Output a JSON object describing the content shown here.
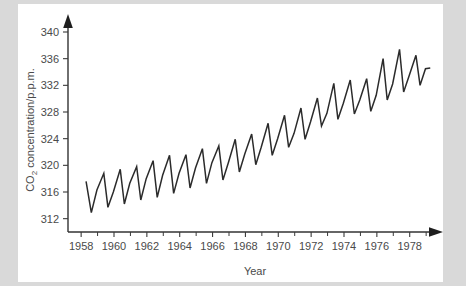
{
  "figure": {
    "background_color": "#d9d9d9",
    "card_color": "#ffffff",
    "line_color": "#2b2b2b",
    "axis_color": "#333333",
    "text_color": "#4a4a4a"
  },
  "chart_data": {
    "type": "line",
    "title": "",
    "xlabel": "Year",
    "ylabel_main": "CO",
    "ylabel_sub": "2",
    "ylabel_rest": " concentration/p.p.m.",
    "ylabel": "CO2 concentration/p.p.m.",
    "xlim": [
      1957.2,
      1979.6
    ],
    "ylim": [
      310.0,
      341.5
    ],
    "grid": false,
    "legend": null,
    "x_major_ticks": [
      1958,
      1960,
      1962,
      1964,
      1966,
      1968,
      1970,
      1972,
      1974,
      1976,
      1978
    ],
    "x_tick_labels": [
      "1958",
      "1960",
      "1962",
      "1964",
      "1966",
      "1968",
      "1970",
      "1972",
      "1974",
      "1976",
      "1978"
    ],
    "x_minor_ticks": [
      1959,
      1961,
      1963,
      1965,
      1967,
      1969,
      1971,
      1973,
      1975,
      1977,
      1979
    ],
    "y_major_ticks": [
      312,
      316,
      320,
      324,
      328,
      332,
      336,
      340
    ],
    "y_tick_labels": [
      "312",
      "316",
      "320",
      "324",
      "328",
      "332",
      "336",
      "340"
    ],
    "series": [
      {
        "name": "CO2 concentration",
        "x": [
          1958.3,
          1958.62,
          1958.96,
          1959.38,
          1959.63,
          1959.96,
          1960.38,
          1960.63,
          1960.96,
          1961.38,
          1961.63,
          1961.96,
          1962.38,
          1962.63,
          1962.96,
          1963.38,
          1963.63,
          1963.96,
          1964.38,
          1964.63,
          1964.96,
          1965.38,
          1965.63,
          1965.96,
          1966.38,
          1966.63,
          1966.96,
          1967.38,
          1967.63,
          1967.96,
          1968.38,
          1968.63,
          1968.96,
          1969.38,
          1969.63,
          1969.96,
          1970.38,
          1970.63,
          1970.96,
          1971.38,
          1971.63,
          1971.96,
          1972.38,
          1972.63,
          1972.96,
          1973.38,
          1973.63,
          1973.96,
          1974.38,
          1974.63,
          1974.96,
          1975.38,
          1975.63,
          1975.96,
          1976.38,
          1976.63,
          1976.96,
          1977.38,
          1977.63,
          1977.96,
          1978.38,
          1978.63,
          1978.96,
          1979.25
        ],
        "values": [
          317.6,
          312.9,
          316.3,
          318.8,
          313.7,
          316.0,
          319.4,
          314.2,
          317.3,
          319.8,
          314.8,
          318.0,
          320.7,
          315.2,
          318.5,
          321.5,
          315.8,
          318.8,
          321.6,
          316.6,
          319.6,
          322.5,
          317.3,
          320.4,
          322.9,
          317.8,
          320.4,
          323.9,
          319.0,
          321.7,
          324.7,
          320.1,
          322.7,
          326.3,
          321.5,
          324.0,
          327.5,
          322.7,
          324.8,
          328.6,
          323.9,
          326.5,
          330.1,
          325.9,
          327.8,
          332.3,
          326.9,
          329.3,
          332.8,
          327.7,
          329.8,
          333.0,
          328.1,
          330.5,
          336.0,
          329.8,
          332.2,
          337.4,
          331.0,
          333.4,
          336.5,
          332.0,
          334.5,
          334.6
        ]
      }
    ],
    "annotations": []
  },
  "axes": {
    "y_axis_name": "y-axis",
    "x_axis_name": "x-axis",
    "y_arrow": "up-arrow-icon",
    "x_arrow": "right-arrow-icon"
  }
}
